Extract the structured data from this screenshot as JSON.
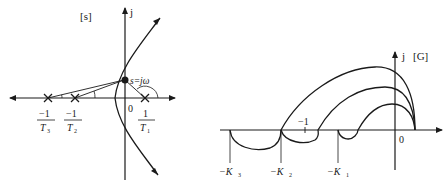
{
  "left_diagram": {
    "plane_label": "[s]",
    "imag_axis_label": "j",
    "origin_label": "0",
    "point_label": "s=jω",
    "poles": [
      {
        "num": "−1",
        "den": "T",
        "sub": "3"
      },
      {
        "num": "−1",
        "den": "T",
        "sub": "2"
      },
      {
        "num": "1",
        "den": "T",
        "sub": "1"
      }
    ]
  },
  "right_diagram": {
    "plane_label": "[G]",
    "imag_axis_label": "j",
    "origin_label": "0",
    "critical_point_label": "−1",
    "intercepts": [
      {
        "label": "−K",
        "sub": "3"
      },
      {
        "label": "−K",
        "sub": "2"
      },
      {
        "label": "−K",
        "sub": "1"
      }
    ]
  }
}
